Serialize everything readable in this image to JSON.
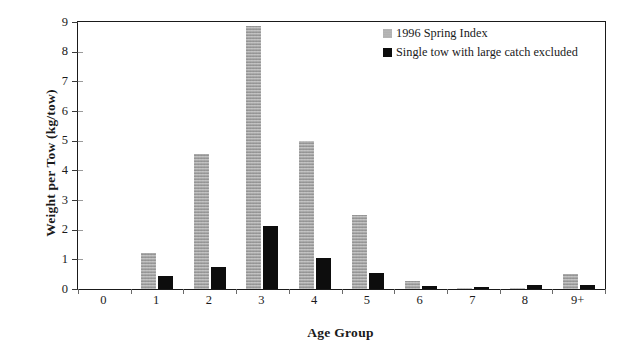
{
  "chart_data": {
    "type": "bar",
    "title": "",
    "xlabel": "Age Group",
    "ylabel": "Weight per Tow (kg/tow)",
    "categories": [
      "0",
      "1",
      "2",
      "3",
      "4",
      "5",
      "6",
      "7",
      "8",
      "9+"
    ],
    "ylim": [
      0,
      9
    ],
    "yticks": [
      "0",
      "1",
      "2",
      "3",
      "4",
      "5",
      "6",
      "7",
      "8",
      "9"
    ],
    "grid": false,
    "legend_position": "top-right",
    "series": [
      {
        "name": "1996 Spring Index",
        "color": "#a8a8a8",
        "swatch": "gray",
        "values": [
          0,
          1.2,
          4.55,
          8.85,
          5.0,
          2.5,
          0.28,
          0.03,
          0.02,
          0.5
        ]
      },
      {
        "name": "Single tow with large catch excluded",
        "color": "#0d0d0d",
        "swatch": "black",
        "values": [
          0,
          0.44,
          0.75,
          2.12,
          1.05,
          0.55,
          0.1,
          0.08,
          0.13,
          0.12
        ]
      }
    ]
  },
  "legend": {
    "entries": [
      {
        "label": "1996 Spring Index"
      },
      {
        "label": "Single tow with large catch excluded"
      }
    ]
  }
}
